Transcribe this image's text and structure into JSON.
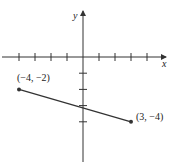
{
  "chart_data": {
    "type": "line",
    "title": "",
    "xlabel": "x",
    "ylabel": "y",
    "xlim": [
      -5,
      5
    ],
    "ylim": [
      -7,
      4
    ],
    "x_ticks": [
      -4,
      -3,
      -2,
      -1,
      1,
      2,
      3,
      4
    ],
    "y_ticks": [
      -1,
      -2,
      -3,
      -4
    ],
    "grid": false,
    "series": [
      {
        "name": "segment",
        "points": [
          {
            "x": -4,
            "y": -2,
            "label": "(−4, −2)"
          },
          {
            "x": 3,
            "y": -4,
            "label": "(3, −4)"
          }
        ]
      }
    ]
  }
}
